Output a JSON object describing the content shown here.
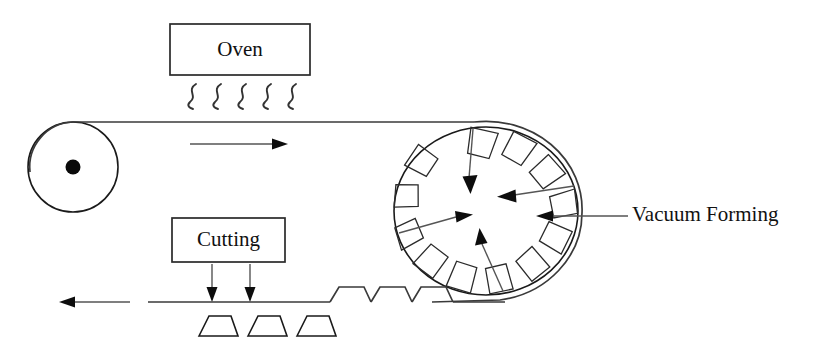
{
  "diagram": {
    "background_color": "#ffffff",
    "line_color": "#1a1a1a",
    "arrow_color": "#555555",
    "labels": {
      "oven": "Oven",
      "cutting": "Cutting",
      "vacuum_forming": "Vacuum Forming"
    },
    "stations": [
      {
        "id": "unwind-roller",
        "name": "Unwind Roller",
        "shape": "circle-with-hub",
        "center_x": 73,
        "center_y": 167,
        "radius": 45,
        "hub_radius": 7
      },
      {
        "id": "oven-box",
        "name": "Oven",
        "shape": "rectangle",
        "x": 170,
        "y": 24,
        "width": 140,
        "height": 51,
        "heat_wave_count": 5
      },
      {
        "id": "forming-drum",
        "name": "Vacuum Forming Drum",
        "shape": "ellipse-with-molds",
        "center_x": 486,
        "center_y": 211,
        "radius_x": 92,
        "radius_y": 84,
        "mold_count": 12
      },
      {
        "id": "cutting-box",
        "name": "Cutting",
        "shape": "rectangle",
        "x": 172,
        "y": 218,
        "width": 113,
        "height": 44,
        "cut_arrow_count": 2
      }
    ],
    "belts": {
      "top_line_y": 122,
      "bottom_line_y": 302,
      "formed_bump_count": 3,
      "cut_part_count": 3
    },
    "flow_arrows": [
      {
        "id": "top-feed-arrow",
        "direction": "right",
        "x1": 190,
        "y1": 144,
        "x2": 282,
        "y2": 144
      },
      {
        "id": "bottom-output-arrow",
        "direction": "left",
        "x1": 130,
        "y1": 302,
        "x2": 60,
        "y2": 302
      }
    ],
    "vacuum_arrows": [
      {
        "id": "vacuum-arrow-top",
        "x1": 473,
        "y1": 128,
        "x2": 470,
        "y2": 190
      },
      {
        "id": "vacuum-arrow-right-upper",
        "x1": 572,
        "y1": 185,
        "x2": 500,
        "y2": 196
      },
      {
        "id": "vacuum-arrow-left",
        "x1": 400,
        "y1": 232,
        "x2": 470,
        "y2": 214
      },
      {
        "id": "vacuum-arrow-bottom",
        "x1": 500,
        "y1": 288,
        "x2": 477,
        "y2": 228
      }
    ],
    "callout": {
      "id": "vacuum-forming-callout",
      "text_x": 632,
      "text_y": 216,
      "leader_x1": 628,
      "leader_x2": 538,
      "leader_y": 216
    }
  }
}
